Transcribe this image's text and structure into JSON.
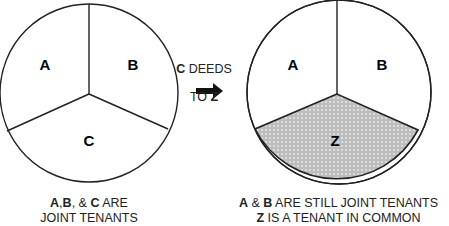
{
  "diagram": {
    "left_pie": {
      "labels": [
        "A",
        "B",
        "C"
      ],
      "caption_line1": {
        "bold1": "A",
        "sep1": ",",
        "bold2": "B",
        "sep2": ", & ",
        "bold3": "C",
        "rest": " ARE"
      },
      "caption_line2": "JOINT TENANTS"
    },
    "transition": {
      "line1_bold": "C",
      "line1_rest": " DEEDS",
      "line2_rest": "TO ",
      "line2_bold": "Z"
    },
    "right_pie": {
      "labels": [
        "A",
        "B",
        "Z"
      ],
      "shaded_segment": "Z",
      "shade_color": "#c4c4c4",
      "caption_line1": {
        "bold1": "A",
        "sep1": " & ",
        "bold2": "B",
        "rest": " ARE STILL JOINT TENANTS"
      },
      "caption_line2": {
        "bold": "Z",
        "rest": " IS A TENANT IN COMMON"
      }
    }
  }
}
